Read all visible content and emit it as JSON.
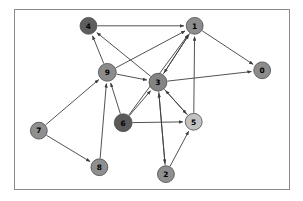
{
  "figure": {
    "title": "",
    "border_color": "#8a8a8a",
    "background": "#ffffff"
  },
  "chart_data": {
    "type": "diagram",
    "subtype": "directed-graph",
    "title": "",
    "xlabel": "",
    "ylabel": "",
    "directed": true,
    "edge_color": "#3d3d3d",
    "node_count": 10,
    "edge_count": 22,
    "nodes": [
      {
        "id": "0",
        "label": "0",
        "x": 249,
        "y": 61,
        "r": 8.5,
        "color": "#8c8c8c"
      },
      {
        "id": "1",
        "label": "1",
        "x": 181,
        "y": 16,
        "r": 8.5,
        "color": "#8c8c8c"
      },
      {
        "id": "2",
        "label": "2",
        "x": 152,
        "y": 166,
        "r": 8.5,
        "color": "#8f8f8f"
      },
      {
        "id": "3",
        "label": "3",
        "x": 144,
        "y": 73,
        "r": 9.0,
        "color": "#848484"
      },
      {
        "id": "4",
        "label": "4",
        "x": 74,
        "y": 16,
        "r": 8.5,
        "color": "#5e5e5e"
      },
      {
        "id": "5",
        "label": "5",
        "x": 180,
        "y": 113,
        "r": 8.5,
        "color": "#c2c2c2"
      },
      {
        "id": "6",
        "label": "6",
        "x": 109,
        "y": 114,
        "r": 9.0,
        "color": "#5a5a5a"
      },
      {
        "id": "7",
        "label": "7",
        "x": 24,
        "y": 122,
        "r": 8.5,
        "color": "#8f8f8f"
      },
      {
        "id": "8",
        "label": "8",
        "x": 85,
        "y": 159,
        "r": 8.5,
        "color": "#8f8f8f"
      },
      {
        "id": "9",
        "label": "9",
        "x": 93,
        "y": 63,
        "r": 9.0,
        "color": "#8c8c8c"
      }
    ],
    "edges": [
      {
        "from": "4",
        "to": "1"
      },
      {
        "from": "9",
        "to": "4"
      },
      {
        "from": "3",
        "to": "4"
      },
      {
        "from": "9",
        "to": "1"
      },
      {
        "from": "9",
        "to": "3"
      },
      {
        "from": "3",
        "to": "1"
      },
      {
        "from": "3",
        "to": "0"
      },
      {
        "from": "1",
        "to": "0"
      },
      {
        "from": "1",
        "to": "3"
      },
      {
        "from": "5",
        "to": "1"
      },
      {
        "from": "7",
        "to": "9"
      },
      {
        "from": "6",
        "to": "9"
      },
      {
        "from": "7",
        "to": "8"
      },
      {
        "from": "8",
        "to": "9"
      },
      {
        "from": "6",
        "to": "3"
      },
      {
        "from": "6",
        "to": "5"
      },
      {
        "from": "3",
        "to": "5"
      },
      {
        "from": "2",
        "to": "5"
      },
      {
        "from": "3",
        "to": "2"
      },
      {
        "from": "2",
        "to": "3"
      },
      {
        "from": "5",
        "to": "3"
      },
      {
        "from": "6",
        "to": "1"
      }
    ]
  }
}
